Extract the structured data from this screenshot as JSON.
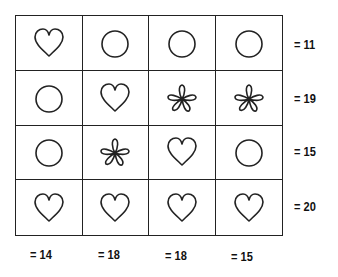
{
  "puzzle": {
    "grid": [
      [
        "heart",
        "circle",
        "circle",
        "circle"
      ],
      [
        "circle",
        "heart",
        "flower",
        "flower"
      ],
      [
        "circle",
        "flower",
        "heart",
        "circle"
      ],
      [
        "heart",
        "heart",
        "heart",
        "heart"
      ]
    ],
    "row_sums": [
      "= 11",
      "= 19",
      "= 15",
      "= 20"
    ],
    "col_sums": [
      "= 14",
      "= 18",
      "= 18",
      "= 15"
    ],
    "colors": {
      "line": "#222222",
      "background": "#ffffff"
    }
  }
}
